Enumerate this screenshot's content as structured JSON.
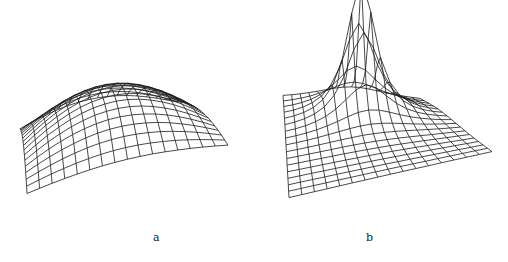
{
  "figure": {
    "panels": [
      {
        "id": "a",
        "label": "a",
        "description": "broad smooth dome wireframe surface"
      },
      {
        "id": "b",
        "label": "b",
        "description": "sharply peaked wireframe surface"
      }
    ]
  }
}
